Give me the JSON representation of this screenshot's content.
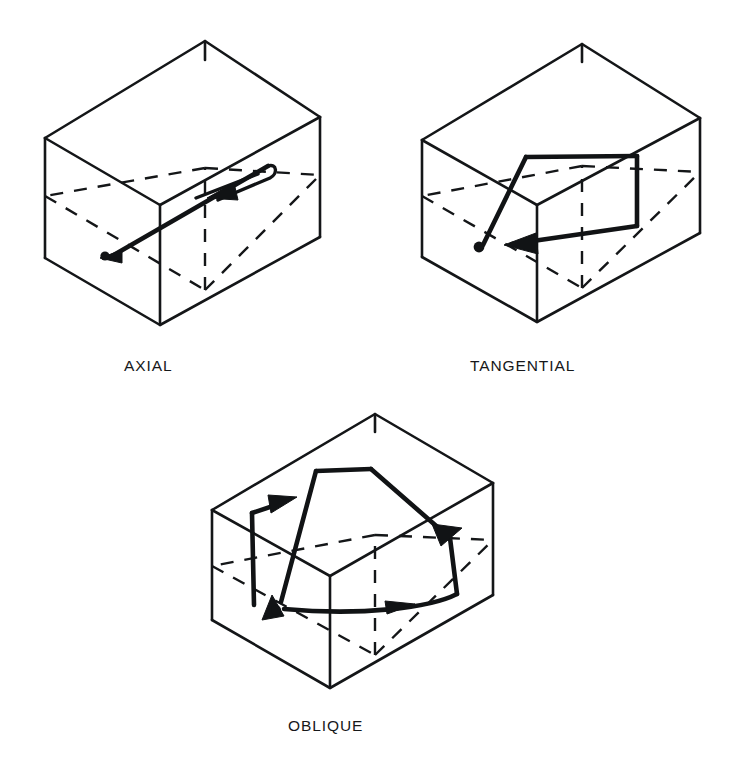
{
  "figure": {
    "background_color": "#ffffff",
    "line_color": "#141618",
    "panels": [
      {
        "id": "axial",
        "label": "AXIAL",
        "label_x": 124,
        "label_y": 371,
        "description": "Rectangular box in isometric view with a narrow elongated axial flow loop along the long axis",
        "box": {
          "top_apex_x": 205,
          "top_apex_y": 41,
          "left_top_x": 45,
          "left_top_y": 138,
          "left_bottom_x": 45,
          "left_bottom_y": 258,
          "right_top_x": 320,
          "right_top_y": 117,
          "right_bottom_x": 320,
          "right_bottom_y": 237,
          "front_top_x": 160,
          "front_top_y": 205,
          "front_bottom_x": 160,
          "front_bottom_y": 325,
          "back_apex_x": 205,
          "back_apex_y": 41
        },
        "flow": {
          "type": "narrow-loop",
          "arrow_count": 2,
          "source_dot_x": 105,
          "source_dot_y": 254
        }
      },
      {
        "id": "tangential",
        "label": "TANGENTIAL",
        "label_x": 470,
        "label_y": 371,
        "description": "Rectangular box in isometric view with a broad quadrilateral tangential flow loop",
        "box": {
          "top_apex_x": 582,
          "top_apex_y": 44,
          "left_top_x": 422,
          "left_top_y": 140,
          "left_bottom_x": 422,
          "left_bottom_y": 257,
          "right_top_x": 700,
          "right_top_y": 118,
          "right_bottom_x": 700,
          "right_bottom_y": 233,
          "front_top_x": 537,
          "front_top_y": 205,
          "front_bottom_x": 537,
          "front_bottom_y": 322
        },
        "flow": {
          "type": "quad-loop",
          "arrow_count": 1,
          "source_dot_x": 478,
          "source_dot_y": 248
        }
      },
      {
        "id": "oblique",
        "label": "OBLIQUE",
        "label_x": 288,
        "label_y": 731,
        "description": "Rectangular box in isometric view with an oblique, skewed closed flow loop",
        "box": {
          "top_apex_x": 375,
          "top_apex_y": 414,
          "left_top_x": 212,
          "left_top_y": 510,
          "left_bottom_x": 212,
          "left_bottom_y": 620,
          "right_top_x": 493,
          "right_top_y": 483,
          "right_bottom_x": 493,
          "right_bottom_y": 595,
          "front_top_x": 330,
          "front_top_y": 576,
          "front_bottom_x": 330,
          "front_bottom_y": 688
        },
        "flow": {
          "type": "oblique-loop",
          "arrow_count": 4,
          "source_dot_x": 275,
          "source_dot_y": 611
        }
      }
    ]
  }
}
